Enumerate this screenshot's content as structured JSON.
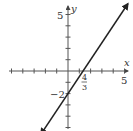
{
  "chart_data": {
    "type": "line",
    "title": "",
    "xlabel": "x",
    "ylabel": "y",
    "xlim": [
      -5.8,
      5.8
    ],
    "ylim": [
      -5.2,
      5.8
    ],
    "grid": false,
    "tick_step": 1,
    "equation": "y = (3/2)x - 2",
    "series": [
      {
        "name": "line",
        "x": [
          -2.4,
          5.3
        ],
        "y": [
          -5.6,
          5.95
        ]
      }
    ],
    "annotations": {
      "x_tick_label": "5",
      "y_tick_label": "5",
      "x_intercept": {
        "value": 1.3333,
        "numerator": "4",
        "denominator": "3"
      },
      "y_intercept": {
        "value": -2,
        "label": "−2"
      }
    },
    "line_color": "#222222",
    "axis_color": "#555555"
  }
}
